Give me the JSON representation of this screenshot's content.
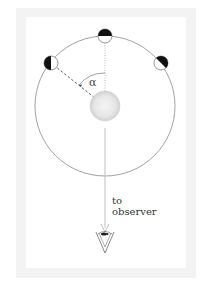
{
  "diagram": {
    "angle_label": "α",
    "observer_label_line1": "to",
    "observer_label_line2": "observer",
    "elements": {
      "orbit": {
        "cx": 105,
        "cy": 106,
        "r": 70
      },
      "star": {
        "cx": 105,
        "cy": 106,
        "r": 15
      },
      "planets": [
        {
          "name": "top",
          "cx": 105,
          "cy": 36,
          "r": 7,
          "dark_side": "top"
        },
        {
          "name": "upper-left",
          "cx": 51,
          "cy": 63,
          "r": 7,
          "dark_side": "left"
        },
        {
          "name": "upper-right",
          "cx": 161,
          "cy": 63,
          "r": 7,
          "dark_side": "right"
        }
      ]
    },
    "colors": {
      "frame": "#f3f3f3",
      "panel": "#ffffff",
      "orbit": "#888888",
      "arrow": "#c8c8c8",
      "planet_dark": "#111111"
    }
  }
}
